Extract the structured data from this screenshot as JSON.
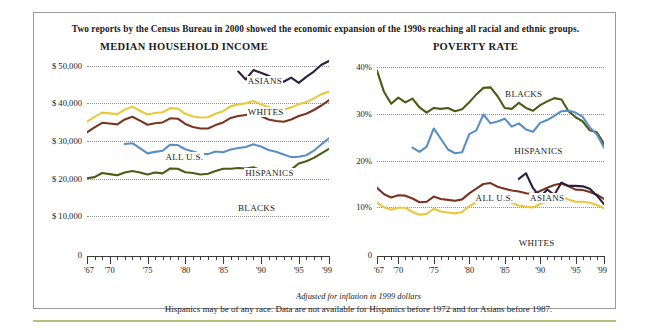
{
  "headline": "Two reports by the Census Bureau in 2000 showed the economic expansion of the 1990s reaching all racial and ethnic groups.",
  "notes": {
    "inflation": "Adjusted for inflation in 1999 dollars",
    "footnote": "Hispanics may be of any race. Data are not available for Hispanics before 1972 and for Asians before 1987."
  },
  "colors": {
    "asians": "#2b2040",
    "whites": "#e9c83c",
    "all_us": "#7a3520",
    "hispanics": "#5b8fc4",
    "blacks": "#4a5c16",
    "grid": "#8e8e8e",
    "axis": "#3a3a3a",
    "frame": "#9a9a9a",
    "bottom_rule": "#b5bf7a"
  },
  "series_labels": {
    "asians": "ASIANS",
    "whites": "WHITES",
    "all_us": "ALL U.S.",
    "hispanics": "HISPANICS",
    "blacks": "BLACKS"
  },
  "chart_data": [
    {
      "type": "line",
      "id": "median-household-income",
      "title": "MEDIAN HOUSEHOLD INCOME",
      "xlabel": "",
      "ylabel": "",
      "xlim": [
        1967,
        1999
      ],
      "ylim": [
        0,
        52000
      ],
      "grid": true,
      "legend_position": "inline-annotations",
      "ytick_labels": [
        "0",
        "$ 10,000",
        "$ 20,000",
        "$ 30,000",
        "$ 40,000",
        "$ 50,000"
      ],
      "yticks": [
        0,
        10000,
        20000,
        30000,
        40000,
        50000
      ],
      "xtick_labels": [
        "'67",
        "'70",
        "'75",
        "'80",
        "'85",
        "'90",
        "'95",
        "'99"
      ],
      "xticks": [
        1967,
        1970,
        1975,
        1980,
        1985,
        1990,
        1995,
        1999
      ],
      "x": [
        1967,
        1968,
        1969,
        1970,
        1971,
        1972,
        1973,
        1974,
        1975,
        1976,
        1977,
        1978,
        1979,
        1980,
        1981,
        1982,
        1983,
        1984,
        1985,
        1986,
        1987,
        1988,
        1989,
        1990,
        1991,
        1992,
        1993,
        1994,
        1995,
        1996,
        1997,
        1998,
        1999
      ],
      "series": [
        {
          "name": "ASIANS",
          "color": "#2b2040",
          "x": [
            1987,
            1988,
            1989,
            1990,
            1991,
            1992,
            1993,
            1994,
            1995,
            1996,
            1997,
            1998,
            1999
          ],
          "values": [
            48400,
            46300,
            48800,
            48100,
            47300,
            46300,
            45700,
            46800,
            45400,
            47000,
            48400,
            50200,
            51200
          ]
        },
        {
          "name": "WHITES",
          "color": "#e9c83c",
          "x": [
            1967,
            1968,
            1969,
            1970,
            1971,
            1972,
            1973,
            1974,
            1975,
            1976,
            1977,
            1978,
            1979,
            1980,
            1981,
            1982,
            1983,
            1984,
            1985,
            1986,
            1987,
            1988,
            1989,
            1990,
            1991,
            1992,
            1993,
            1994,
            1995,
            1996,
            1997,
            1998,
            1999
          ],
          "values": [
            35100,
            36400,
            37500,
            37300,
            37100,
            38300,
            39100,
            38000,
            37000,
            37400,
            37600,
            38700,
            38600,
            37200,
            36500,
            36200,
            36300,
            37200,
            37900,
            39200,
            39700,
            40000,
            40600,
            39700,
            38900,
            38500,
            38300,
            38900,
            39700,
            40300,
            41300,
            42400,
            43100
          ]
        },
        {
          "name": "ALL U.S.",
          "color": "#7a3520",
          "values": [
            32300,
            33600,
            34800,
            34600,
            34400,
            35700,
            36400,
            35400,
            34300,
            34700,
            34900,
            36000,
            35900,
            34500,
            33700,
            33300,
            33300,
            34200,
            34900,
            36100,
            36600,
            36900,
            37500,
            36600,
            35700,
            35300,
            35100,
            35700,
            36600,
            37200,
            38200,
            39400,
            40800
          ]
        },
        {
          "name": "HISPANICS",
          "color": "#5b8fc4",
          "x": [
            1972,
            1973,
            1974,
            1975,
            1976,
            1977,
            1978,
            1979,
            1980,
            1981,
            1982,
            1983,
            1984,
            1985,
            1986,
            1987,
            1988,
            1989,
            1990,
            1991,
            1992,
            1993,
            1994,
            1995,
            1996,
            1997,
            1998,
            1999
          ],
          "values": [
            29200,
            29400,
            28100,
            26700,
            27100,
            27400,
            29000,
            28900,
            27800,
            27200,
            26600,
            26500,
            27200,
            27000,
            27700,
            28100,
            28400,
            29100,
            28500,
            27600,
            27100,
            26400,
            25700,
            25800,
            26200,
            27400,
            29100,
            30700
          ]
        },
        {
          "name": "BLACKS",
          "color": "#4a5c16",
          "values": [
            20100,
            20400,
            21500,
            21200,
            20900,
            21600,
            22000,
            21600,
            21100,
            21600,
            21400,
            22700,
            22600,
            21700,
            21500,
            21100,
            21300,
            22000,
            22600,
            22600,
            22800,
            22700,
            23000,
            22300,
            21800,
            21400,
            21600,
            22400,
            24000,
            24600,
            25500,
            26700,
            27900
          ]
        }
      ]
    },
    {
      "type": "line",
      "id": "poverty-rate",
      "title": "POVERTY RATE",
      "xlabel": "",
      "ylabel": "",
      "xlim": [
        1967,
        1999
      ],
      "ylim": [
        0,
        42
      ],
      "grid": true,
      "legend_position": "inline-annotations",
      "ytick_labels": [
        "0",
        "10%",
        "20%",
        "30%",
        "40%"
      ],
      "yticks": [
        0,
        10,
        20,
        30,
        40
      ],
      "xtick_labels": [
        "'67",
        "'70",
        "'75",
        "'80",
        "'85",
        "'90",
        "'95",
        "'99"
      ],
      "xticks": [
        1967,
        1970,
        1975,
        1980,
        1985,
        1990,
        1995,
        1999
      ],
      "x": [
        1967,
        1968,
        1969,
        1970,
        1971,
        1972,
        1973,
        1974,
        1975,
        1976,
        1977,
        1978,
        1979,
        1980,
        1981,
        1982,
        1983,
        1984,
        1985,
        1986,
        1987,
        1988,
        1989,
        1990,
        1991,
        1992,
        1993,
        1994,
        1995,
        1996,
        1997,
        1998,
        1999
      ],
      "series": [
        {
          "name": "BLACKS",
          "color": "#4a5c16",
          "values": [
            39.3,
            34.7,
            32.2,
            33.5,
            32.5,
            33.3,
            31.4,
            30.3,
            31.3,
            31.1,
            31.3,
            30.6,
            31.0,
            32.5,
            34.2,
            35.6,
            35.7,
            33.8,
            31.3,
            31.1,
            32.4,
            31.3,
            30.7,
            31.9,
            32.7,
            33.4,
            33.1,
            30.6,
            29.3,
            28.4,
            26.5,
            26.1,
            23.6
          ]
        },
        {
          "name": "HISPANICS",
          "color": "#5b8fc4",
          "x": [
            1972,
            1973,
            1974,
            1975,
            1976,
            1977,
            1978,
            1979,
            1980,
            1981,
            1982,
            1983,
            1984,
            1985,
            1986,
            1987,
            1988,
            1989,
            1990,
            1991,
            1992,
            1993,
            1994,
            1995,
            1996,
            1997,
            1998,
            1999
          ],
          "values": [
            22.8,
            21.9,
            23.0,
            26.9,
            24.7,
            22.4,
            21.6,
            21.8,
            25.7,
            26.5,
            29.9,
            28.0,
            28.4,
            29.0,
            27.3,
            28.0,
            26.7,
            26.2,
            28.1,
            28.7,
            29.6,
            30.6,
            30.7,
            30.3,
            29.4,
            27.1,
            25.6,
            22.8
          ]
        },
        {
          "name": "ALL U.S.",
          "color": "#7a3520",
          "values": [
            14.2,
            12.8,
            12.1,
            12.6,
            12.5,
            11.9,
            11.1,
            11.2,
            12.3,
            11.8,
            11.6,
            11.4,
            11.7,
            13.0,
            14.0,
            15.0,
            15.2,
            14.4,
            14.0,
            13.6,
            13.4,
            13.0,
            12.8,
            13.5,
            14.2,
            14.8,
            15.1,
            14.5,
            13.8,
            13.7,
            13.3,
            12.7,
            11.8
          ]
        },
        {
          "name": "ASIANS",
          "color": "#2b2040",
          "x": [
            1987,
            1988,
            1989,
            1990,
            1991,
            1992,
            1993,
            1994,
            1995,
            1996,
            1997,
            1998,
            1999
          ],
          "values": [
            16.1,
            17.3,
            14.1,
            12.2,
            13.8,
            12.7,
            15.3,
            14.6,
            14.6,
            14.5,
            14.0,
            12.5,
            10.7
          ]
        },
        {
          "name": "WHITES",
          "color": "#e9c83c",
          "values": [
            11.0,
            10.0,
            9.5,
            9.9,
            9.9,
            9.0,
            8.4,
            8.6,
            9.7,
            9.1,
            8.9,
            8.7,
            9.0,
            10.2,
            11.1,
            12.0,
            12.1,
            11.5,
            11.4,
            11.0,
            10.4,
            10.1,
            10.0,
            10.7,
            11.3,
            11.9,
            12.2,
            11.7,
            11.2,
            11.2,
            11.0,
            10.5,
            9.8
          ]
        }
      ]
    }
  ],
  "annotations": {
    "income": [
      {
        "label": "ASIANS",
        "x_pct": 66,
        "y_pct": 9
      },
      {
        "label": "WHITES",
        "x_pct": 66,
        "y_pct": 25
      },
      {
        "label": "ALL U.S.",
        "x_pct": 32,
        "y_pct": 48
      },
      {
        "label": "HISPANICS",
        "x_pct": 65,
        "y_pct": 56
      },
      {
        "label": "BLACKS",
        "x_pct": 62,
        "y_pct": 74
      }
    ],
    "poverty": [
      {
        "label": "BLACKS",
        "x_pct": 56,
        "y_pct": 16
      },
      {
        "label": "HISPANICS",
        "x_pct": 60,
        "y_pct": 45
      },
      {
        "label": "ALL U.S.",
        "x_pct": 43,
        "y_pct": 69
      },
      {
        "label": "ASIANS",
        "x_pct": 67,
        "y_pct": 69
      },
      {
        "label": "WHITES",
        "x_pct": 62,
        "y_pct": 92
      }
    ]
  }
}
